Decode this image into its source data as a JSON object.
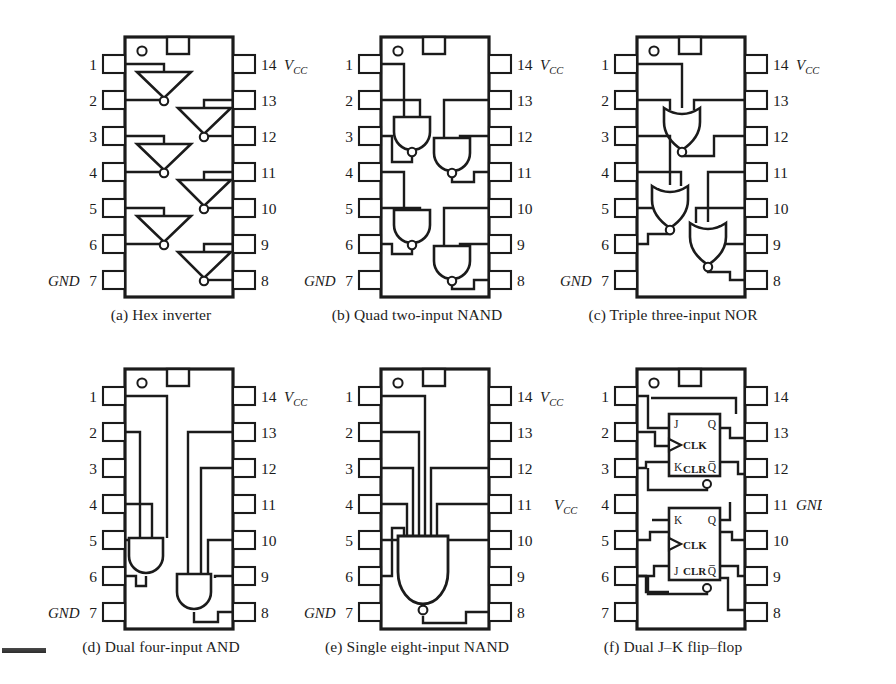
{
  "figure": {
    "rows": 2,
    "cols": 3,
    "pin_count": 14,
    "line_color": "#1b1b1b",
    "background": "#ffffff"
  },
  "chips": [
    {
      "id": "a",
      "caption": "(a) Hex inverter",
      "function": "Hex inverter",
      "gate_type": "inverter",
      "gate_count": 6,
      "left_pins": [
        "1",
        "2",
        "3",
        "4",
        "5",
        "6",
        "7"
      ],
      "right_pins": [
        "14",
        "13",
        "12",
        "11",
        "10",
        "9",
        "8"
      ],
      "left_rail_label": "GND",
      "left_rail_pin": "7",
      "right_rail_label": "VCC",
      "right_rail_pin": "14",
      "notch": "top-center",
      "dot": "top-left"
    },
    {
      "id": "b",
      "caption": "(b) Quad two-input NAND",
      "function": "Quad two-input NAND",
      "gate_type": "nand",
      "gate_count": 4,
      "left_pins": [
        "1",
        "2",
        "3",
        "4",
        "5",
        "6",
        "7"
      ],
      "right_pins": [
        "14",
        "13",
        "12",
        "11",
        "10",
        "9",
        "8"
      ],
      "left_rail_label": "GND",
      "left_rail_pin": "7",
      "right_rail_label": "VCC",
      "right_rail_pin": "14",
      "notch": "top-center",
      "dot": "top-left"
    },
    {
      "id": "c",
      "caption": "(c) Triple three-input NOR",
      "function": "Triple three-input NOR",
      "gate_type": "nor",
      "gate_count": 3,
      "left_pins": [
        "1",
        "2",
        "3",
        "4",
        "5",
        "6",
        "7"
      ],
      "right_pins": [
        "14",
        "13",
        "12",
        "11",
        "10",
        "9",
        "8"
      ],
      "left_rail_label": "GND",
      "left_rail_pin": "7",
      "right_rail_label": "VCC",
      "right_rail_pin": "14",
      "notch": "top-center",
      "dot": "top-left"
    },
    {
      "id": "d",
      "caption": "(d) Dual four-input AND",
      "function": "Dual four-input AND",
      "gate_type": "and",
      "gate_count": 2,
      "left_pins": [
        "1",
        "2",
        "3",
        "4",
        "5",
        "6",
        "7"
      ],
      "right_pins": [
        "14",
        "13",
        "12",
        "11",
        "10",
        "9",
        "8"
      ],
      "left_rail_label": "GND",
      "left_rail_pin": "7",
      "right_rail_label": "VCC",
      "right_rail_pin": "14",
      "notch": "top-center",
      "dot": "top-left"
    },
    {
      "id": "e",
      "caption": "(e) Single eight-input NAND",
      "function": "Single eight-input NAND",
      "gate_type": "nand",
      "gate_count": 1,
      "left_pins": [
        "1",
        "2",
        "3",
        "4",
        "5",
        "6",
        "7"
      ],
      "right_pins": [
        "14",
        "13",
        "12",
        "11",
        "10",
        "9",
        "8"
      ],
      "left_rail_label": "GND",
      "left_rail_pin": "7",
      "right_rail_label": "VCC",
      "right_rail_pin": "14",
      "notch": "top-center",
      "dot": "top-left"
    },
    {
      "id": "f",
      "caption": "(f) Dual J–K flip–flop",
      "function": "Dual J-K flip-flop",
      "gate_type": "jk-flipflop",
      "gate_count": 2,
      "left_pins": [
        "1",
        "2",
        "3",
        "4",
        "5",
        "6",
        "7"
      ],
      "right_pins": [
        "14",
        "13",
        "12",
        "11",
        "10",
        "9",
        "8"
      ],
      "left_rail_label": "VCC",
      "left_rail_pin": "4",
      "right_rail_label": "GND",
      "right_rail_pin": "11",
      "notch": "top-center",
      "dot": "top-left",
      "flipflops": [
        {
          "index": 1,
          "top_left": "J",
          "bottom_left": "K",
          "clock": "CLK",
          "clear": "CLR",
          "top_right": "Q",
          "bottom_right": "Q̅"
        },
        {
          "index": 2,
          "top_left": "K",
          "bottom_left": "J",
          "clock": "CLK",
          "clear": "CLR",
          "top_right": "Q",
          "bottom_right": "Q̅"
        }
      ]
    }
  ],
  "labels": {
    "vcc_base": "V",
    "vcc_sub": "CC",
    "gnd": "GND"
  }
}
